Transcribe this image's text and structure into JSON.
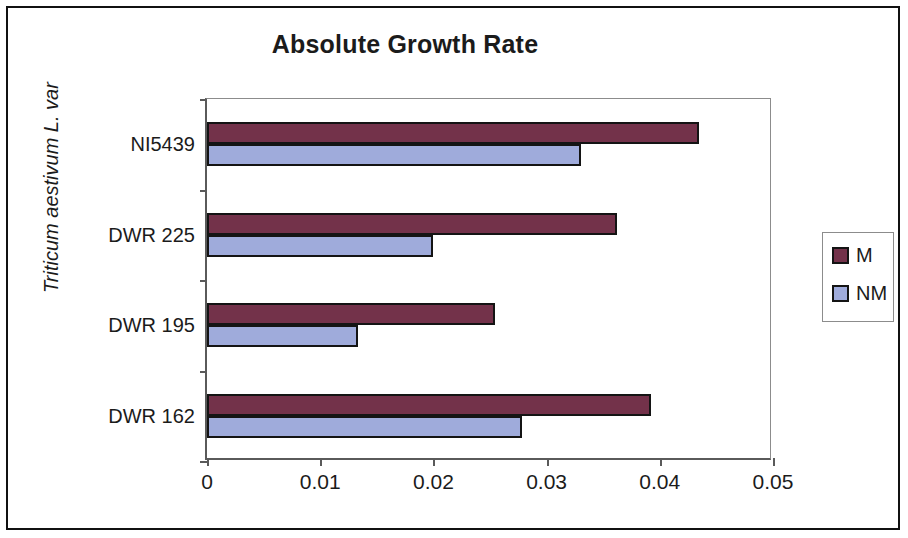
{
  "chart_data": {
    "type": "bar",
    "orientation": "horizontal",
    "title": "Absolute Growth Rate",
    "xlabel": "",
    "ylabel": "Triticum aestivum L. var",
    "categories": [
      "DWR 162",
      "DWR 195",
      "DWR 225",
      "NI5439"
    ],
    "series": [
      {
        "name": "M",
        "color": "#73324a",
        "values": [
          0.0392,
          0.0254,
          0.0362,
          0.0435
        ]
      },
      {
        "name": "NM",
        "color": "#9fabdb",
        "values": [
          0.0278,
          0.0133,
          0.02,
          0.033
        ]
      }
    ],
    "xlim": [
      0,
      0.05
    ],
    "xticks": [
      0,
      0.01,
      0.02,
      0.03,
      0.04,
      0.05
    ],
    "xtick_labels": [
      "0",
      "0.01",
      "0.02",
      "0.03",
      "0.04",
      "0.05"
    ],
    "grid": false,
    "legend_position": "right"
  },
  "legend": {
    "entries": [
      {
        "label": "M"
      },
      {
        "label": "NM"
      }
    ]
  }
}
